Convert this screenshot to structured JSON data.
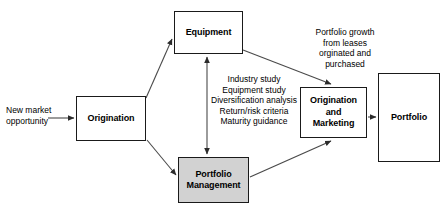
{
  "diagram": {
    "background_color": "#ffffff",
    "line_color": "#3a3a3a",
    "box_border_color": "#1a1a1a",
    "shaded_box_fill": "#d2d2d2",
    "nodes": [
      {
        "id": "equipment",
        "label": "Equipment",
        "shaded": false
      },
      {
        "id": "origination",
        "label": "Origination",
        "shaded": false
      },
      {
        "id": "om",
        "label": "Origination\nand\nMarketing",
        "shaded": false
      },
      {
        "id": "portfolio",
        "label": "Portfolio",
        "shaded": false
      },
      {
        "id": "pm",
        "label": "Portfolio\nManagement",
        "shaded": true
      }
    ],
    "annotations": [
      {
        "id": "new-market",
        "text": "New market\nopportunity",
        "align": "left"
      },
      {
        "id": "criteria",
        "text": "Industry study\nEquipment study\nDiversification analysis\nReturn/risk criteria\nMaturity guidance",
        "align": "center"
      },
      {
        "id": "growth",
        "text": "Portfolio growth\nfrom leases\norginated and\npurchased",
        "align": "center"
      }
    ],
    "connectors": [
      {
        "id": "new-market-to-origination",
        "from": "new-market",
        "to": "origination",
        "style": "straight",
        "arrowheads": "end"
      },
      {
        "id": "origination-to-equipment",
        "from": "origination",
        "to": "equipment",
        "style": "diagonal",
        "arrowheads": "end"
      },
      {
        "id": "origination-to-pm",
        "from": "origination",
        "to": "pm",
        "style": "diagonal",
        "arrowheads": "end"
      },
      {
        "id": "equipment-pm-bidirectional",
        "from": "equipment",
        "to": "pm",
        "style": "vertical",
        "arrowheads": "both"
      },
      {
        "id": "equipment-to-om",
        "from": "equipment",
        "to": "om",
        "style": "diagonal",
        "arrowheads": "end"
      },
      {
        "id": "pm-to-om",
        "from": "pm",
        "to": "om",
        "style": "diagonal",
        "arrowheads": "end"
      },
      {
        "id": "om-to-portfolio",
        "from": "om",
        "to": "portfolio",
        "style": "straight",
        "arrowheads": "end"
      }
    ]
  }
}
